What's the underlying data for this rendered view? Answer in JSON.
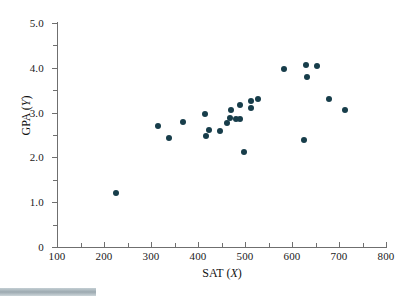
{
  "figure": {
    "background_color": "#ffffff",
    "axis_color": "#6f6f6f",
    "marker_color": "#173d4a"
  },
  "chart_data": {
    "type": "scatter",
    "title": "",
    "xlabel": "SAT (X)",
    "xlabel_main": "SAT",
    "xlabel_var": "X",
    "ylabel": "GPA (Y)",
    "ylabel_main": "GPA",
    "ylabel_var": "Y",
    "xlim": [
      100,
      800
    ],
    "ylim": [
      0,
      5.25
    ],
    "grid": false,
    "legend": null,
    "x_ticks": [
      100,
      200,
      300,
      400,
      500,
      600,
      700,
      800
    ],
    "x_tick_labels": [
      "100",
      "200",
      "300",
      "400",
      "500",
      "600",
      "700",
      "800"
    ],
    "x_minor_ticks": [
      150,
      250,
      350,
      450,
      550,
      650,
      750
    ],
    "y_ticks": [
      0,
      1.0,
      2.0,
      3.0,
      4.0,
      5.0
    ],
    "y_tick_labels": [
      "0",
      "1.0",
      "2.0",
      "3.0",
      "4.0",
      "5.0"
    ],
    "y_minor_ticks": [
      0.5,
      1.5,
      2.5,
      3.5,
      4.5
    ],
    "marker": "filled-circle",
    "marker_size": 6,
    "points": [
      {
        "x": 225,
        "y": 1.2
      },
      {
        "x": 315,
        "y": 2.7
      },
      {
        "x": 338,
        "y": 2.43
      },
      {
        "x": 367,
        "y": 2.8
      },
      {
        "x": 415,
        "y": 2.98
      },
      {
        "x": 417,
        "y": 2.48
      },
      {
        "x": 424,
        "y": 2.62
      },
      {
        "x": 446,
        "y": 2.6
      },
      {
        "x": 462,
        "y": 2.77
      },
      {
        "x": 467,
        "y": 2.87
      },
      {
        "x": 471,
        "y": 3.05
      },
      {
        "x": 480,
        "y": 2.86
      },
      {
        "x": 489,
        "y": 2.85
      },
      {
        "x": 490,
        "y": 3.18
      },
      {
        "x": 498,
        "y": 2.12
      },
      {
        "x": 512,
        "y": 3.25
      },
      {
        "x": 513,
        "y": 3.1
      },
      {
        "x": 527,
        "y": 3.31
      },
      {
        "x": 583,
        "y": 3.97
      },
      {
        "x": 625,
        "y": 2.4
      },
      {
        "x": 630,
        "y": 4.06
      },
      {
        "x": 632,
        "y": 3.8
      },
      {
        "x": 653,
        "y": 4.04
      },
      {
        "x": 678,
        "y": 3.3
      },
      {
        "x": 713,
        "y": 3.05
      }
    ]
  }
}
